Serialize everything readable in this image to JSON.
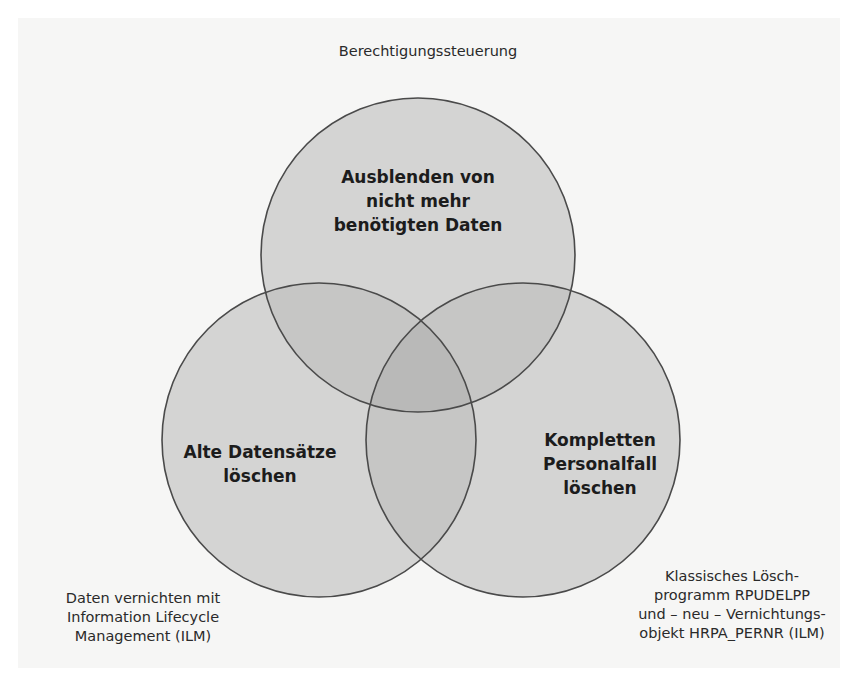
{
  "diagram": {
    "type": "venn",
    "colors": {
      "background": "#f6f6f5",
      "circle_fill": "#d4d4d3",
      "overlap_2": "#c3c3c2",
      "overlap_3": "#b7b7b6",
      "stroke": "#4a4a4a"
    },
    "circles": [
      {
        "id": "top",
        "label": "Ausblenden von\nnicht mehr\nbenötigten Daten",
        "outer_label": "Berechtigungssteuerung"
      },
      {
        "id": "left",
        "label": "Alte Datensätze\nlöschen",
        "outer_label": "Daten vernichten mit\nInformation Lifecycle\nManagement (ILM)"
      },
      {
        "id": "right",
        "label": "Kompletten\nPersonalfall\nlöschen",
        "outer_label": "Klassisches Lösch-\nprogramm RPUDELPP\nund – neu – Vernichtungs-\nobjekt HRPA_PERNR (ILM)"
      }
    ]
  }
}
